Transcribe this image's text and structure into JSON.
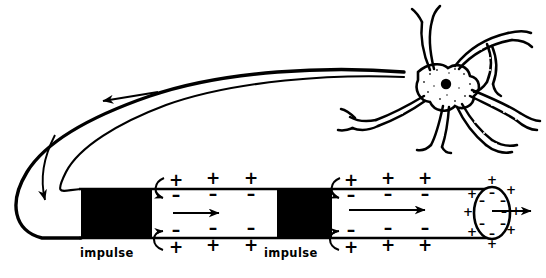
{
  "figure": {
    "ink_color": "#000000",
    "background_color": "#ffffff",
    "labels": {
      "impulse_left": "impulse",
      "impulse_right": "impulse"
    },
    "membrane_charges": {
      "outside_resting": "+",
      "inside_resting": "–",
      "outside_depolarized": "–",
      "inside_depolarized": "+",
      "top_outer_row": [
        "+",
        "+",
        "+",
        "+",
        "+",
        "+"
      ],
      "top_inner_row": [
        "–",
        "–",
        "–",
        "–",
        "–",
        "–"
      ],
      "bottom_inner_row": [
        "–",
        "–",
        "–",
        "–",
        "–",
        "–"
      ],
      "bottom_outer_row": [
        "+",
        "+",
        "+",
        "+",
        "+",
        "+"
      ],
      "terminal_outer_ring": [
        "+",
        "+",
        "+",
        "+",
        "+",
        "+",
        "+",
        "+"
      ],
      "terminal_inner_ring": [
        "–",
        "–",
        "–",
        "–",
        "–",
        "–",
        "–"
      ]
    },
    "parts": {
      "cell_body": "cell body (soma) with nucleus",
      "dendrites": "branching dendrites",
      "axon": "long looping axon",
      "axon_terminal": "open axon terminal",
      "active_regions": "two darkened depolarized segments"
    },
    "arrows": {
      "axon_flow_top": "leftward arrow along upper axon",
      "axon_loop": "downward arrow around the left-hand bend",
      "internal_1": "rightward conduction arrow in first segment",
      "internal_2": "rightward conduction arrow in second segment",
      "terminal_out": "rightward arrow leaving the axon terminal",
      "ion_flow": "curved local-circuit arrows at each impulse front"
    }
  }
}
